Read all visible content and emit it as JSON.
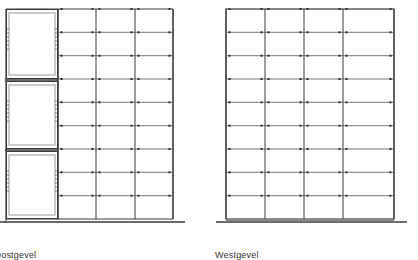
{
  "colors": {
    "line": "#3a3a3a",
    "thin": "#6a6a6a",
    "panel": "#9a9a9a",
    "dot": "#2a2a2a",
    "background": "#ffffff"
  },
  "left_elevation": {
    "caption": "Oostgevel",
    "frame": {
      "x": 6,
      "y": 9,
      "right": 173,
      "bottom": 219
    },
    "panel_column": {
      "x": 6,
      "right": 58
    },
    "panels": [
      {
        "top": 9,
        "bottom": 79
      },
      {
        "top": 81,
        "bottom": 149
      },
      {
        "top": 151,
        "bottom": 219
      }
    ],
    "grid_verticals": [
      58,
      96,
      135,
      173
    ],
    "grid_rows": [
      9,
      32.3,
      55.7,
      79,
      102.3,
      125.7,
      149,
      172.3,
      195.7,
      219
    ],
    "ground": {
      "x1": 0,
      "x2": 185,
      "y": 222
    }
  },
  "right_elevation": {
    "caption": "Westgevel",
    "frame": {
      "x": 226,
      "y": 9,
      "right": 394,
      "bottom": 219
    },
    "grid_verticals": [
      226,
      265,
      304,
      343,
      394
    ],
    "grid_rows": [
      9,
      32.3,
      55.7,
      79,
      102.3,
      125.7,
      149,
      172.3,
      195.7,
      219
    ],
    "ground": {
      "x1": 216,
      "x2": 407,
      "y": 222
    }
  }
}
